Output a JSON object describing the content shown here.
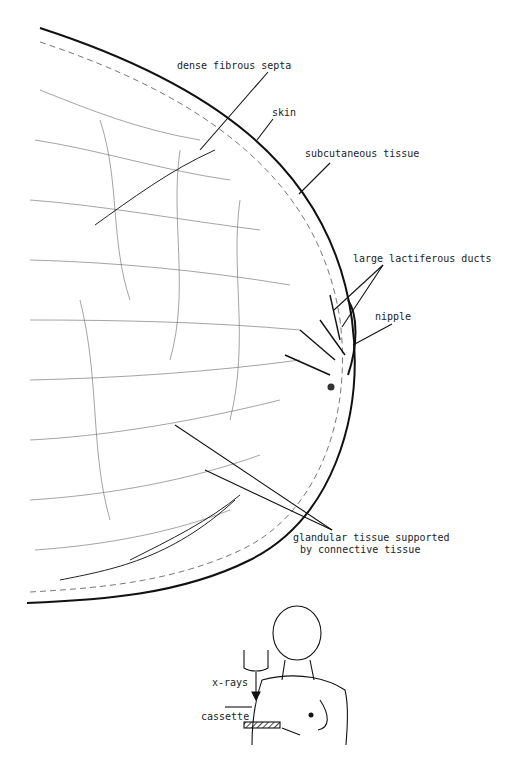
{
  "diagram": {
    "labels": {
      "dense_fibrous_septa": "dense fibrous septa",
      "skin": "skin",
      "subcutaneous_tissue": "subcutaneous tissue",
      "large_lactiferous_ducts": "large lactiferous ducts",
      "nipple": "nipple",
      "glandular_tissue_line1": "glandular tissue supported",
      "glandular_tissue_line2": "by connective tissue"
    },
    "inset": {
      "xrays": "x-rays",
      "cassette": "cassette"
    },
    "colors": {
      "line": "#111111",
      "texture": "#555555",
      "background": "#ffffff"
    }
  }
}
